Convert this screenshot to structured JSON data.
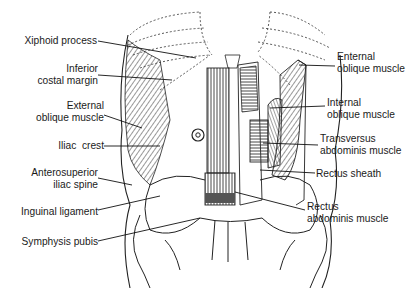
{
  "figure": {
    "left_labels": [
      {
        "id": "xiphoid",
        "lines": [
          "Xiphoid process"
        ]
      },
      {
        "id": "costal",
        "lines": [
          "Inferior",
          "costal margin"
        ]
      },
      {
        "id": "ext-oblique-left",
        "lines": [
          "External",
          "oblique muscle"
        ]
      },
      {
        "id": "iliac-crest",
        "lines": [
          "Iliac  crest"
        ]
      },
      {
        "id": "asis",
        "lines": [
          "Anterosuperior",
          "iliac spine"
        ]
      },
      {
        "id": "inguinal",
        "lines": [
          "Inguinal ligament"
        ]
      },
      {
        "id": "symphysis",
        "lines": [
          "Symphysis pubis"
        ]
      }
    ],
    "right_labels": [
      {
        "id": "ext-oblique-right",
        "lines": [
          "Enternal",
          "oblique muscle"
        ]
      },
      {
        "id": "int-oblique",
        "lines": [
          "Internal",
          "oblique muscle"
        ]
      },
      {
        "id": "transversus",
        "lines": [
          "Transversus",
          "abdominis muscle"
        ]
      },
      {
        "id": "rectus-sheath",
        "lines": [
          "Rectus sheath"
        ]
      },
      {
        "id": "rectus-abdominis",
        "lines": [
          "Rectus",
          "abdominis muscle"
        ]
      }
    ]
  }
}
